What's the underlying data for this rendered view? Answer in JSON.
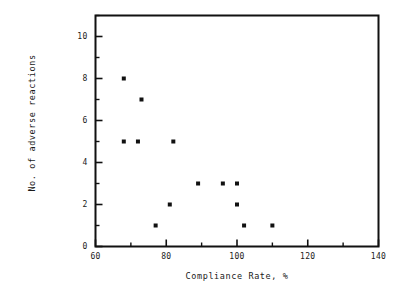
{
  "chart_data": {
    "type": "scatter",
    "title": "",
    "xlabel": "Compliance Rate, %",
    "ylabel": "No. of adverse reactions",
    "xlim": [
      60,
      140
    ],
    "ylim": [
      0,
      11
    ],
    "grid": false,
    "legend": null,
    "x_major_ticks": [
      60,
      80,
      100,
      120,
      140
    ],
    "x_major_tick_labels": [
      "60",
      "80",
      "100",
      "120",
      "140"
    ],
    "x_minor_ticks": [
      70,
      90,
      110,
      130
    ],
    "y_major_ticks": [
      0,
      2,
      4,
      6,
      8,
      10
    ],
    "y_major_tick_labels": [
      "0",
      "2",
      "4",
      "6",
      "8",
      "10"
    ],
    "y_minor_ticks": [
      1,
      3,
      5,
      7,
      9,
      11
    ],
    "marker": "square",
    "marker_color": "#111111",
    "marker_size": 4,
    "points": [
      {
        "x": 68,
        "y": 8
      },
      {
        "x": 73,
        "y": 7
      },
      {
        "x": 68,
        "y": 5
      },
      {
        "x": 72,
        "y": 5
      },
      {
        "x": 82,
        "y": 5
      },
      {
        "x": 89,
        "y": 3
      },
      {
        "x": 96,
        "y": 3
      },
      {
        "x": 100,
        "y": 3
      },
      {
        "x": 81,
        "y": 2
      },
      {
        "x": 100,
        "y": 2
      },
      {
        "x": 77,
        "y": 1
      },
      {
        "x": 102,
        "y": 1
      },
      {
        "x": 110,
        "y": 1
      }
    ],
    "x_values": [
      68,
      73,
      68,
      72,
      82,
      89,
      96,
      100,
      81,
      100,
      77,
      102,
      110
    ],
    "y_values": [
      8,
      7,
      5,
      5,
      5,
      3,
      3,
      3,
      2,
      2,
      1,
      1,
      1
    ]
  },
  "axes": {
    "frame_color": "#111111",
    "background": "#ffffff"
  }
}
